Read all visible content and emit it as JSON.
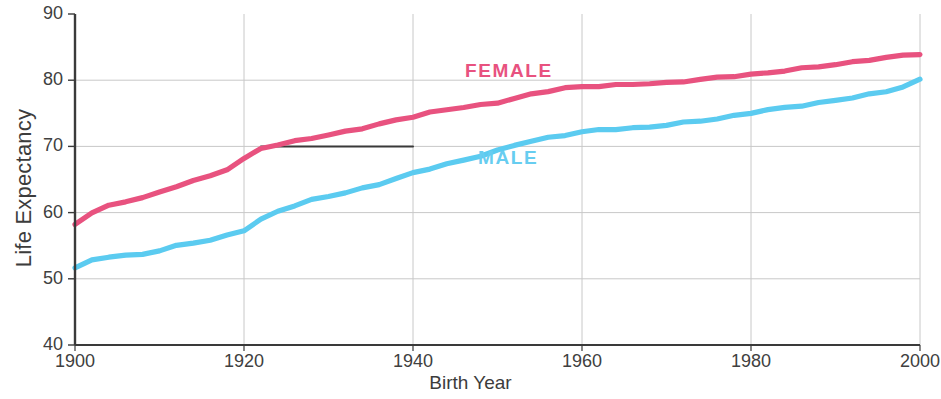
{
  "chart_data": {
    "type": "line",
    "title": "",
    "xlabel": "Birth Year",
    "ylabel": "Life Expectancy",
    "xlim": [
      1900,
      2000
    ],
    "ylim": [
      40,
      90
    ],
    "x_ticks": [
      1900,
      1920,
      1940,
      1960,
      1980,
      2000
    ],
    "y_ticks": [
      40,
      50,
      60,
      70,
      80,
      90
    ],
    "grid": "horizontal-and-vertical",
    "legend_position": "inline-on-plot",
    "x": [
      1900,
      1902,
      1904,
      1906,
      1908,
      1910,
      1912,
      1914,
      1916,
      1918,
      1920,
      1922,
      1924,
      1926,
      1928,
      1930,
      1932,
      1934,
      1936,
      1938,
      1940,
      1942,
      1944,
      1946,
      1948,
      1950,
      1952,
      1954,
      1956,
      1958,
      1960,
      1962,
      1964,
      1966,
      1968,
      1970,
      1972,
      1974,
      1976,
      1978,
      1980,
      1982,
      1984,
      1986,
      1988,
      1990,
      1992,
      1994,
      1996,
      1998,
      2000
    ],
    "series": [
      {
        "name": "FEMALE",
        "color": "#e8527f",
        "values": [
          58.3,
          60.1,
          61.0,
          61.6,
          62.2,
          63.0,
          64.0,
          64.8,
          65.5,
          66.6,
          68.2,
          69.8,
          70.3,
          70.7,
          71.2,
          71.7,
          72.2,
          72.7,
          73.3,
          74.0,
          74.6,
          75.2,
          75.6,
          75.9,
          76.2,
          76.6,
          77.2,
          77.8,
          78.3,
          78.8,
          79.1,
          79.2,
          79.3,
          79.4,
          79.5,
          79.6,
          79.8,
          80.0,
          80.3,
          80.6,
          80.9,
          81.2,
          81.5,
          81.8,
          82.1,
          82.4,
          82.7,
          83.0,
          83.3,
          83.7,
          84.0
        ]
      },
      {
        "name": "MALE",
        "color": "#5bcbf0",
        "values": [
          51.6,
          52.8,
          53.4,
          53.6,
          53.8,
          54.3,
          54.9,
          55.4,
          55.8,
          56.5,
          57.3,
          58.9,
          60.2,
          61.2,
          62.0,
          62.5,
          63.0,
          63.6,
          64.3,
          65.1,
          65.9,
          66.6,
          67.3,
          68.0,
          68.7,
          69.4,
          70.2,
          70.8,
          71.3,
          71.7,
          72.1,
          72.4,
          72.6,
          72.8,
          73.0,
          73.3,
          73.6,
          73.9,
          74.2,
          74.6,
          75.0,
          75.4,
          75.8,
          76.2,
          76.6,
          77.0,
          77.4,
          77.9,
          78.4,
          79.0,
          80.0
        ]
      }
    ],
    "annotations": [
      {
        "type": "horizontal-reference-line",
        "value": 70,
        "x_start": 1922,
        "x_end": 1940,
        "color": "#3a3a3a"
      }
    ]
  },
  "axes": {
    "y_title": "Life Expectancy",
    "x_title": "Birth Year",
    "y_tick_labels": [
      "90",
      "80",
      "70",
      "60",
      "50",
      "40"
    ],
    "x_tick_labels": [
      "1900",
      "1920",
      "1940",
      "1960",
      "1980",
      "2000"
    ]
  },
  "legend": {
    "female_label": "FEMALE",
    "male_label": "MALE"
  },
  "colors": {
    "female": "#e8527f",
    "male": "#5bcbf0",
    "grid": "#c8c8c8",
    "axis": "#3a3a3a",
    "background": "#ffffff"
  }
}
